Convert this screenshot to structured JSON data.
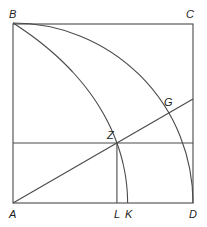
{
  "diagram": {
    "square": {
      "A": [
        13,
        203
      ],
      "side": 180
    },
    "angle_deg": 30,
    "labels": {
      "A": "A",
      "B": "B",
      "C": "C",
      "D": "D",
      "G": "G",
      "Z": "Z",
      "L": "L",
      "K": "K"
    },
    "label_positions": {
      "A": [
        9,
        218
      ],
      "B": [
        9,
        18
      ],
      "C": [
        186,
        18
      ],
      "D": [
        189,
        218
      ],
      "G": [
        164,
        106
      ],
      "Z": [
        107,
        139
      ],
      "L": [
        114,
        218
      ],
      "K": [
        125,
        218
      ]
    },
    "stroke_color": "#4a4a4a"
  }
}
